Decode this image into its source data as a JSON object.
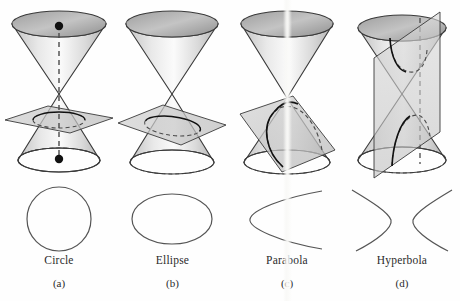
{
  "figure": {
    "background_color": "#fefefe",
    "outline_color": "#3a3a3a",
    "curve_color": "#555555",
    "cone_fill_light": "#f2f2f2",
    "cone_fill_mid": "#d6d6d6",
    "cone_fill_dark": "#a8a8a8",
    "plane_fill": "#c9c9c9",
    "dashed_color": "#4a4a4a",
    "text_color": "#2b2b2b"
  },
  "panels": [
    {
      "id": "circle",
      "name": "Circle",
      "letter": "(a)",
      "left": 0,
      "width": 118,
      "cone": {
        "type": "double-cone",
        "plane_orientation": "horizontal",
        "section_curve": "circle",
        "has_axis_dashed_line": true,
        "focus_dots": 2,
        "dot_positions": [
          "upper-nappe-top",
          "lower-nappe-base"
        ]
      },
      "curve": {
        "shape": "circle",
        "cx": 59,
        "cy": 33,
        "rx": 32,
        "ry": 32
      }
    },
    {
      "id": "ellipse",
      "name": "Ellipse",
      "letter": "(b)",
      "left": 115,
      "width": 115,
      "cone": {
        "type": "double-cone",
        "plane_orientation": "tilted-oblique",
        "section_curve": "ellipse",
        "has_axis_dashed_line": false,
        "focus_dots": 0,
        "dot_positions": []
      },
      "curve": {
        "shape": "ellipse",
        "cx": 57,
        "cy": 33,
        "rx": 40,
        "ry": 25
      }
    },
    {
      "id": "parabola",
      "name": "Parabola",
      "letter": "(c)",
      "left": 230,
      "width": 114,
      "cone": {
        "type": "double-cone",
        "plane_orientation": "parallel-to-slant",
        "section_curve": "parabola",
        "has_axis_dashed_line": false,
        "focus_dots": 0,
        "dot_positions": []
      },
      "curve": {
        "shape": "parabola",
        "opens": "right",
        "vertex_x": 12,
        "vertex_y": 33
      }
    },
    {
      "id": "hyperbola",
      "name": "Hyperbola",
      "letter": "(d)",
      "left": 344,
      "width": 116,
      "cone": {
        "type": "double-cone",
        "plane_orientation": "vertical",
        "section_curve": "hyperbola",
        "has_axis_dashed_line": true,
        "focus_dots": 0,
        "dot_positions": []
      },
      "curve": {
        "shape": "hyperbola",
        "branches": 2,
        "opens": "left-and-right"
      }
    }
  ]
}
